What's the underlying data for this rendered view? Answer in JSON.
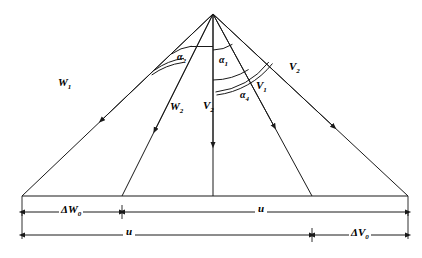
{
  "figure": {
    "type": "geometric-ray-diagram",
    "apex": {
      "x": 213,
      "y": 14
    },
    "baseline_y": 196
  },
  "rays": [
    {
      "id": "w1",
      "label": "W",
      "sub": "1",
      "end_x": 22,
      "label_x": 58,
      "label_y": 77,
      "arrow_t": 0.62
    },
    {
      "id": "w2",
      "label": "W",
      "sub": "2",
      "end_x": 122,
      "label_x": 170,
      "label_y": 101,
      "arrow_t": 0.64
    },
    {
      "id": "v2c",
      "label": "V",
      "sub": "2",
      "end_x": 213,
      "label_x": 203,
      "label_y": 100,
      "arrow_t": 0.72
    },
    {
      "id": "v1",
      "label": "V",
      "sub": "1",
      "end_x": 312,
      "label_x": 256,
      "label_y": 80,
      "arrow_t": 0.62
    },
    {
      "id": "v2r",
      "label": "V",
      "sub": "2",
      "end_x": 408,
      "label_x": 289,
      "label_y": 61,
      "arrow_t": 0.62
    }
  ],
  "angles": [
    {
      "id": "a1",
      "label": "α",
      "sub": "1",
      "label_x": 219,
      "label_y": 55
    },
    {
      "id": "a2",
      "label": "α",
      "sub": "2",
      "label_x": 177,
      "label_y": 52
    },
    {
      "id": "a4",
      "label": "α",
      "sub": "4",
      "label_x": 240,
      "label_y": 90
    }
  ],
  "dimensions": {
    "row1": [
      {
        "id": "dW0",
        "label": "ΔW",
        "sub": "0",
        "from_x": 22,
        "to_x": 122,
        "label_x": 59,
        "label_y": 204
      },
      {
        "id": "u_right",
        "label": "u",
        "sub": "",
        "from_x": 122,
        "to_x": 408,
        "label_x": 255,
        "label_y": 203
      }
    ],
    "row2": [
      {
        "id": "u_left",
        "label": "u",
        "sub": "",
        "from_x": 22,
        "to_x": 312,
        "label_x": 123,
        "label_y": 226
      },
      {
        "id": "dV0",
        "label": "ΔV",
        "sub": "0",
        "from_x": 312,
        "to_x": 408,
        "label_x": 349,
        "label_y": 227
      }
    ],
    "row1_y": 212,
    "row2_y": 235
  },
  "colors": {
    "line": "#1a1a1a",
    "background": "#ffffff"
  }
}
